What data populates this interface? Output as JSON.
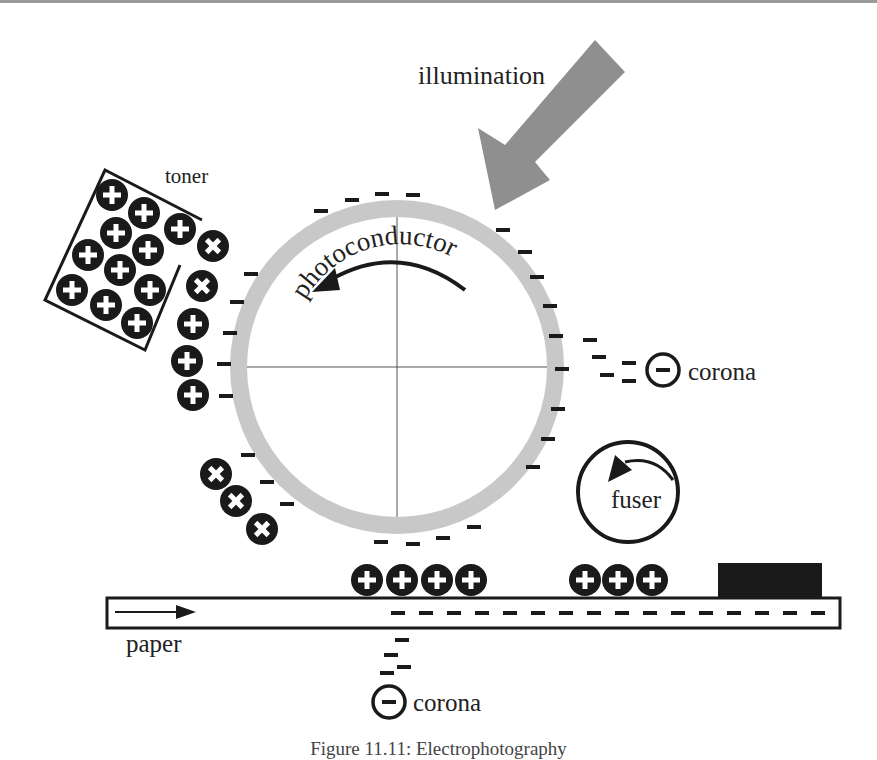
{
  "labels": {
    "illumination": "illumination",
    "toner": "toner",
    "photoconductor": "photoconductor",
    "corona_right": "corona",
    "corona_bottom": "corona",
    "fuser": "fuser",
    "paper": "paper"
  },
  "caption": "Figure 11.11: Electrophotography",
  "symbols": {
    "positive": "+",
    "negative": "−"
  },
  "colors": {
    "drum": "#c8c8c8",
    "arrow": "#8f8f8f",
    "ink": "#1a1a1a",
    "rule": "#9a9a9a"
  }
}
